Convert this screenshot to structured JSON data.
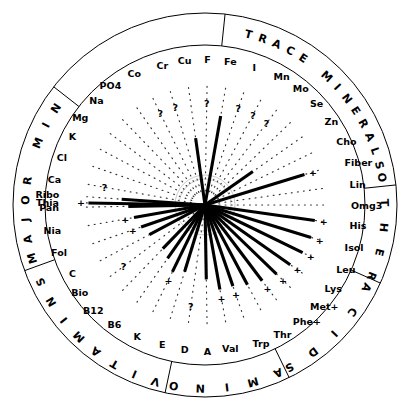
{
  "figure": {
    "background": "#ffffff",
    "ink": "#000000",
    "center": {
      "x": 205,
      "y": 205
    },
    "outer_radius": 192,
    "inner_radius": 160,
    "marker_radius": 124
  },
  "ring_sectors": [
    {
      "name": "trace-minerals",
      "text": "TRACE MINERALS",
      "start_deg": -76,
      "end_deg": -14
    },
    {
      "name": "other",
      "text": "OTHER",
      "start_deg": -10,
      "end_deg": 22
    },
    {
      "name": "acids",
      "text": "ACIDS",
      "start_deg": 26,
      "end_deg": 62
    },
    {
      "name": "amino",
      "text": "AMINO",
      "start_deg": 66,
      "end_deg": 100
    },
    {
      "name": "vitamins",
      "text": "VITAMINS",
      "start_deg": 106,
      "end_deg": 156
    },
    {
      "name": "major-min",
      "text": "MAJOR MIN",
      "start_deg": 164,
      "end_deg": 214
    }
  ],
  "chart_data": {
    "type": "radial-star",
    "value_axis": "spoke length from center (0 = center, 1 = marker ring)",
    "categories_note": "40 nutrient spokes, clockwise starting at Ca (left, just above Thia)",
    "spokes": [
      {
        "label": "Ca",
        "group": "major-min",
        "angle_deg": 190,
        "value": 0.0,
        "marker": "?",
        "solid": false
      },
      {
        "label": "Cl",
        "group": "major-min",
        "angle_deg": 199,
        "value": 0.0,
        "marker": null,
        "solid": false
      },
      {
        "label": "K",
        "group": "major-min",
        "angle_deg": 208,
        "value": 0.0,
        "marker": null,
        "solid": false
      },
      {
        "label": "Mg",
        "group": "major-min",
        "angle_deg": 217,
        "value": 0.0,
        "marker": null,
        "solid": false
      },
      {
        "label": "Na",
        "group": "major-min",
        "angle_deg": 226,
        "value": 0.0,
        "marker": null,
        "solid": false
      },
      {
        "label": "PO4",
        "group": "major-min",
        "angle_deg": 235,
        "value": 0.0,
        "marker": null,
        "solid": false
      },
      {
        "label": "Co",
        "group": "trace-minerals",
        "angle_deg": 244,
        "value": 0.0,
        "marker": "?",
        "solid": false
      },
      {
        "label": "Cr",
        "group": "trace-minerals",
        "angle_deg": 253,
        "value": 0.0,
        "marker": "?",
        "solid": false
      },
      {
        "label": "Cu",
        "group": "trace-minerals",
        "angle_deg": 262,
        "value": 0.54,
        "marker": null,
        "solid": true
      },
      {
        "label": "F",
        "group": "trace-minerals",
        "angle_deg": 271,
        "value": 0.0,
        "marker": "?",
        "solid": false
      },
      {
        "label": "Fe",
        "group": "trace-minerals",
        "angle_deg": 280,
        "value": 0.74,
        "marker": null,
        "solid": true
      },
      {
        "label": "I",
        "group": "trace-minerals",
        "angle_deg": 289,
        "value": 0.0,
        "marker": "?",
        "solid": false
      },
      {
        "label": "Mn",
        "group": "trace-minerals",
        "angle_deg": 298,
        "value": 0.0,
        "marker": "?",
        "solid": false
      },
      {
        "label": "Mo",
        "group": "trace-minerals",
        "angle_deg": 307,
        "value": 0.0,
        "marker": "?",
        "solid": false
      },
      {
        "label": "Se",
        "group": "trace-minerals",
        "angle_deg": 316,
        "value": 0.0,
        "marker": null,
        "solid": false
      },
      {
        "label": "Zn",
        "group": "trace-minerals",
        "angle_deg": 325,
        "value": 0.46,
        "marker": null,
        "solid": true
      },
      {
        "label": "Cho",
        "group": "other",
        "angle_deg": 334,
        "value": 0.0,
        "marker": null,
        "solid": false
      },
      {
        "label": "Fiber",
        "group": "other",
        "angle_deg": 343,
        "value": 0.86,
        "marker": "+",
        "solid": true
      },
      {
        "label": "Lin",
        "group": "other",
        "angle_deg": 352,
        "value": 0.0,
        "marker": null,
        "solid": false
      },
      {
        "label": "Omg3",
        "group": "other",
        "angle_deg": 360,
        "value": 0.0,
        "marker": null,
        "solid": false
      },
      {
        "label": "His",
        "group": "amino",
        "angle_deg": 8,
        "value": 0.92,
        "marker": "+",
        "solid": true
      },
      {
        "label": "Isol",
        "group": "amino",
        "angle_deg": 17,
        "value": 0.92,
        "marker": "+",
        "solid": true
      },
      {
        "label": "Leu",
        "group": "amino",
        "angle_deg": 26,
        "value": 0.9,
        "marker": "+",
        "solid": true
      },
      {
        "label": "Lys",
        "group": "amino",
        "angle_deg": 35,
        "value": 0.86,
        "marker": "+",
        "solid": true
      },
      {
        "label": "Met+",
        "group": "amino",
        "angle_deg": 44,
        "value": 0.82,
        "marker": "+",
        "solid": true
      },
      {
        "label": "Phe+",
        "group": "amino",
        "angle_deg": 53,
        "value": 0.78,
        "marker": "+",
        "solid": true
      },
      {
        "label": "Thr",
        "group": "amino",
        "angle_deg": 62,
        "value": 0.74,
        "marker": null,
        "solid": true
      },
      {
        "label": "Trp",
        "group": "amino",
        "angle_deg": 71,
        "value": 0.7,
        "marker": "+",
        "solid": true
      },
      {
        "label": "Val",
        "group": "amino",
        "angle_deg": 80,
        "value": 0.7,
        "marker": "+",
        "solid": true
      },
      {
        "label": "A",
        "group": "vitamins",
        "angle_deg": 89,
        "value": 0.6,
        "marker": null,
        "solid": true
      },
      {
        "label": "D",
        "group": "vitamins",
        "angle_deg": 98,
        "value": 0.0,
        "marker": "?",
        "solid": false
      },
      {
        "label": "E",
        "group": "vitamins",
        "angle_deg": 107,
        "value": 0.56,
        "marker": null,
        "solid": true
      },
      {
        "label": "K",
        "group": "vitamins",
        "angle_deg": 116,
        "value": 0.6,
        "marker": "+",
        "solid": true
      },
      {
        "label": "B6",
        "group": "vitamins",
        "angle_deg": 125,
        "value": 0.52,
        "marker": null,
        "solid": true
      },
      {
        "label": "B12",
        "group": "vitamins",
        "angle_deg": 134,
        "value": 0.48,
        "marker": null,
        "solid": true
      },
      {
        "label": "Bio",
        "group": "vitamins",
        "angle_deg": 143,
        "value": 0.0,
        "marker": "?",
        "solid": false
      },
      {
        "label": "C",
        "group": "vitamins",
        "angle_deg": 152,
        "value": 0.5,
        "marker": null,
        "solid": true
      },
      {
        "label": "Fol",
        "group": "vitamins",
        "angle_deg": 161,
        "value": 0.54,
        "marker": "+",
        "solid": true
      },
      {
        "label": "Nia",
        "group": "vitamins",
        "angle_deg": 170,
        "value": 0.58,
        "marker": "+",
        "solid": true
      },
      {
        "label": "Pan",
        "group": "vitamins",
        "angle_deg": 179,
        "value": 0.62,
        "marker": null,
        "solid": true
      },
      {
        "label": "Ribo",
        "group": "vitamins",
        "angle_deg": 184,
        "value": 0.68,
        "marker": null,
        "solid": true
      },
      {
        "label": "Thia",
        "group": "vitamins",
        "angle_deg": 181,
        "value": 0.97,
        "marker": "+",
        "solid": true
      }
    ]
  }
}
